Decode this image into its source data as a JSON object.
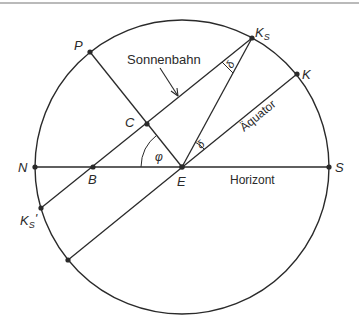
{
  "diagram": {
    "type": "celestial-sphere-construction",
    "colors": {
      "stroke": "#2a2a2a",
      "background": "#ffffff",
      "top_rule": "#777777"
    },
    "labels": {
      "sonnenbahn": "Sonnenbahn",
      "aequator": "Äquator",
      "horizont": "Horizont",
      "P": "P",
      "C": "C",
      "N": "N",
      "B": "B",
      "E": "E",
      "S": "S",
      "K": "K",
      "Ks_main": "K",
      "Ks_sub": "S",
      "Ks2_main": "K",
      "Ks2_sub": "S",
      "Ks2_prime": "'",
      "phi": "φ",
      "delta1": "δ",
      "delta2": "δ"
    },
    "points": {
      "E": [
        182,
        167
      ],
      "N": [
        35,
        167
      ],
      "S": [
        329,
        167
      ],
      "B": [
        93,
        167
      ],
      "C": [
        147,
        124
      ],
      "P": [
        90,
        52
      ],
      "Ks": [
        252,
        38
      ],
      "K": [
        297,
        74
      ],
      "Ks_prime": [
        41,
        208
      ],
      "equator_low": [
        68,
        260
      ]
    },
    "circle": {
      "cx": 182,
      "cy": 167,
      "r": 147
    }
  }
}
